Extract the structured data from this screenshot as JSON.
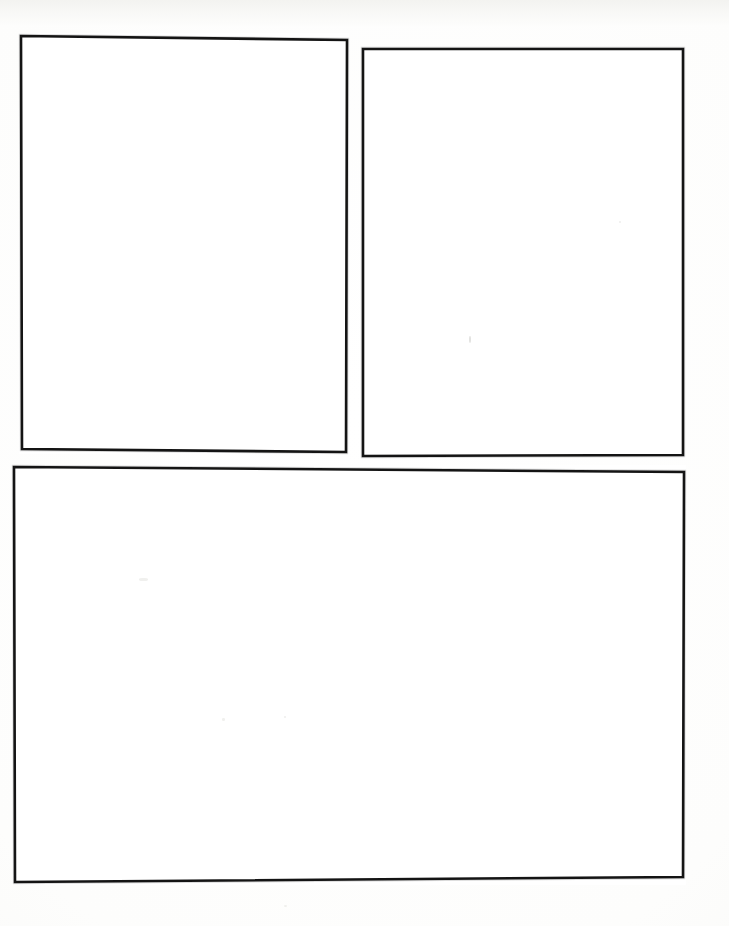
{
  "document": {
    "kind": "blank-comic-panel-template",
    "surface": "scanned-white-paper",
    "page_width": 729,
    "page_height": 926,
    "paper_color": "#fdfdfc",
    "ink_color": "#141414",
    "panel_fill": "#ffffff",
    "halo_color": "#8a8a8a",
    "panel_count": 3,
    "text_content": ""
  },
  "panels": [
    {
      "id": "panel-top-left",
      "label": "",
      "content": "",
      "x": 19,
      "y": 33,
      "width": 330,
      "height": 421,
      "skew_note": "top edge drops ~4px left-to-right"
    },
    {
      "id": "panel-top-right",
      "label": "",
      "content": "",
      "x": 361,
      "y": 47,
      "width": 324,
      "height": 411,
      "skew_note": "frame sits slightly lower than left panel"
    },
    {
      "id": "panel-bottom-wide",
      "label": "",
      "content": "",
      "x": 12,
      "y": 465,
      "width": 674,
      "height": 420,
      "skew_note": "bottom edge drops ~5px left-to-right"
    }
  ],
  "artifacts": [
    {
      "id": "speck-center-right",
      "x": 469,
      "y": 336,
      "width": 2,
      "height": 7,
      "tone": "faint"
    },
    {
      "id": "speck-upper-right",
      "x": 619,
      "y": 221,
      "width": 2,
      "height": 2,
      "tone": "very-faint"
    },
    {
      "id": "speck-lower-left",
      "x": 139,
      "y": 578,
      "width": 9,
      "height": 3,
      "tone": "very-faint"
    },
    {
      "id": "speck-lower-mid",
      "x": 222,
      "y": 718,
      "width": 3,
      "height": 3,
      "tone": "very-faint"
    },
    {
      "id": "speck-bottom-right",
      "x": 284,
      "y": 716,
      "width": 2,
      "height": 2,
      "tone": "very-faint"
    },
    {
      "id": "speck-bottom-edge",
      "x": 284,
      "y": 905,
      "width": 3,
      "height": 2,
      "tone": "very-faint"
    }
  ]
}
